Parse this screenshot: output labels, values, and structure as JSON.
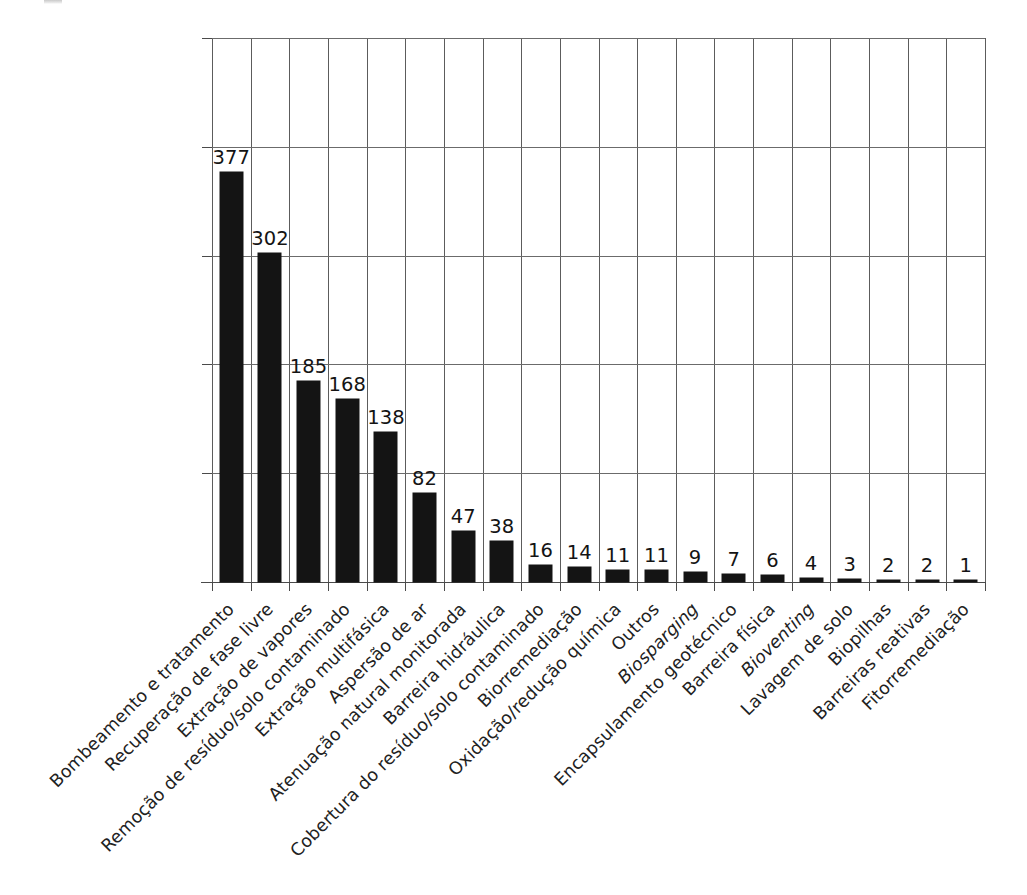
{
  "chart_data": {
    "type": "bar",
    "title": "",
    "xlabel": "",
    "ylabel": "",
    "ylim": [
      0,
      500
    ],
    "yticks": [
      0,
      100,
      200,
      300,
      400,
      500
    ],
    "ytick_labels": [
      "0",
      "100",
      "200",
      "300",
      "400",
      "500"
    ],
    "grid": true,
    "legend": null,
    "bar_color": "#141414",
    "categories": [
      "Bombeamento e tratamento",
      "Recuperação de fase livre",
      "Extração de vapores",
      "Remoção de resíduo/solo contaminado",
      "Extração multifásica",
      "Aspersão de ar",
      "Atenuação natural monitorada",
      "Barreira hidráulica",
      "Cobertura do resíduo/solo contaminado",
      "Biorremediação",
      "Oxidação/redução química",
      "Outros",
      "Biosparging",
      "Encapsulamento geotécnico",
      "Barreira física",
      "Bioventing",
      "Lavagem de solo",
      "Biopilhas",
      "Barreiras reativas",
      "Fitorremediação"
    ],
    "categories_italic": [
      false,
      false,
      false,
      false,
      false,
      false,
      false,
      false,
      false,
      false,
      false,
      false,
      true,
      false,
      false,
      true,
      false,
      false,
      false,
      false
    ],
    "values": [
      377,
      302,
      185,
      168,
      138,
      82,
      47,
      38,
      16,
      14,
      11,
      11,
      9,
      7,
      6,
      4,
      3,
      2,
      2,
      1
    ],
    "value_labels": [
      "377",
      "302",
      "185",
      "168",
      "138",
      "82",
      "47",
      "38",
      "16",
      "14",
      "11",
      "11",
      "9",
      "7",
      "6",
      "4",
      "3",
      "2",
      "2",
      "1"
    ]
  }
}
